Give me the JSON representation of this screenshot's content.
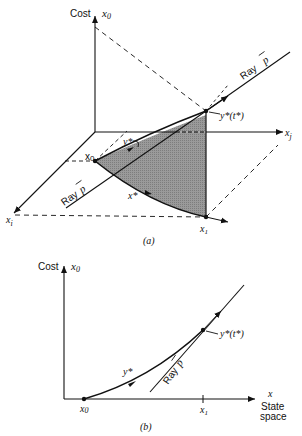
{
  "figure_a": {
    "caption": "(a)",
    "axis_cost_label": "Cost",
    "axis_x0_label": "x",
    "axis_x0_sub": "0",
    "axis_xj_label": "x",
    "axis_xj_sub": "j",
    "axis_xi_label": "x",
    "axis_xi_sub": "i",
    "ray_upper_label": "Ray",
    "ray_upper_symbol": "p",
    "ray_lower_label": "Ray",
    "ray_lower_symbol": "p",
    "point_x0_label": "x",
    "point_x0_sub": "0",
    "point_x1_label": "x",
    "point_x1_sub": "1",
    "curve_ystar_label": "y*",
    "curve_xstar_label": "x*",
    "endpoint_label": "y*(t*)",
    "shaded_color": "#9a9a9a"
  },
  "figure_b": {
    "caption": "(b)",
    "axis_cost_label": "Cost",
    "axis_x0_label": "x",
    "axis_x0_sub": "0",
    "axis_x_label": "x",
    "axis_state_label_1": "State",
    "axis_state_label_2": "space",
    "point_x0_label": "x",
    "point_x0_sub": "0",
    "tick_x1_label": "x",
    "tick_x1_sub": "1",
    "curve_ystar_label": "y*",
    "endpoint_label": "y*(t*)",
    "ray_label": "Ray",
    "ray_symbol": "p"
  }
}
